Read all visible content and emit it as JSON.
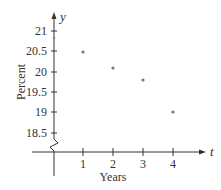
{
  "chart_data": {
    "type": "scatter",
    "title": "",
    "xlabel": "Years",
    "ylabel": "Percent",
    "x_axis_var": "t",
    "y_axis_var": "y",
    "x": [
      1,
      2,
      3,
      4
    ],
    "values": [
      20.5,
      20.1,
      19.8,
      19.0
    ],
    "series": [
      {
        "name": "Percent",
        "x": [
          1,
          2,
          3,
          4
        ],
        "values": [
          20.5,
          20.1,
          19.8,
          19.0
        ]
      }
    ],
    "x_ticks": [
      "1",
      "2",
      "3",
      "4"
    ],
    "y_ticks": [
      "18.5",
      "19",
      "19.5",
      "20",
      "20.5",
      "21"
    ],
    "ylim": [
      18.5,
      21
    ],
    "axis_break": "y-axis break (zigzag) between 0 and 18.5",
    "grid": false,
    "legend": "none",
    "point_color": "#777777"
  },
  "labels": {
    "x_var": "t",
    "y_var": "y",
    "xlabel": "Years",
    "ylabel": "Percent",
    "x_ticks": [
      "1",
      "2",
      "3",
      "4"
    ],
    "y_ticks": [
      "18.5",
      "19",
      "19.5",
      "20",
      "20.5",
      "21"
    ]
  }
}
